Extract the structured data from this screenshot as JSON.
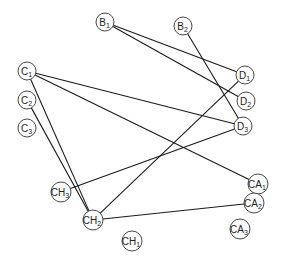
{
  "diagram": {
    "type": "bipartite-graph",
    "nodes": [
      {
        "id": "B1",
        "base": "B",
        "sub": "1",
        "x": 105,
        "y": 22,
        "r": 9
      },
      {
        "id": "B2",
        "base": "B",
        "sub": "2",
        "x": 183,
        "y": 26,
        "r": 9
      },
      {
        "id": "C1",
        "base": "C",
        "sub": "1",
        "x": 27,
        "y": 71,
        "r": 9
      },
      {
        "id": "C2",
        "base": "C",
        "sub": "2",
        "x": 27,
        "y": 100,
        "r": 9
      },
      {
        "id": "C3",
        "base": "C",
        "sub": "3",
        "x": 27,
        "y": 128,
        "r": 9
      },
      {
        "id": "D1",
        "base": "D",
        "sub": "1",
        "x": 245,
        "y": 75,
        "r": 9
      },
      {
        "id": "D2",
        "base": "D",
        "sub": "2",
        "x": 246,
        "y": 101,
        "r": 9
      },
      {
        "id": "D3",
        "base": "D",
        "sub": "3",
        "x": 243,
        "y": 126,
        "r": 9
      },
      {
        "id": "CH3",
        "base": "CH",
        "sub": "3",
        "x": 61,
        "y": 192,
        "r": 10
      },
      {
        "id": "CH2",
        "base": "CH",
        "sub": "2",
        "x": 93,
        "y": 220,
        "r": 10
      },
      {
        "id": "CH1",
        "base": "CH",
        "sub": "1",
        "x": 132,
        "y": 241,
        "r": 10
      },
      {
        "id": "CA1",
        "base": "CA",
        "sub": "1",
        "x": 258,
        "y": 184,
        "r": 10
      },
      {
        "id": "CA2",
        "base": "CA",
        "sub": "2",
        "x": 254,
        "y": 203,
        "r": 10
      },
      {
        "id": "CA3",
        "base": "CA",
        "sub": "3",
        "x": 240,
        "y": 229,
        "r": 10
      }
    ],
    "edges": [
      {
        "from": "B1",
        "to": "D1"
      },
      {
        "from": "B1",
        "to": "D2"
      },
      {
        "from": "B2",
        "to": "D3"
      },
      {
        "from": "C1",
        "to": "D3"
      },
      {
        "from": "C1",
        "to": "CA1"
      },
      {
        "from": "C1",
        "to": "CH2"
      },
      {
        "from": "C2",
        "to": "CH2"
      },
      {
        "from": "CH3",
        "to": "D3"
      },
      {
        "from": "CH2",
        "to": "D1"
      },
      {
        "from": "CH2",
        "to": "CA2"
      }
    ],
    "colors": {
      "edge": "#1a1a1a",
      "node_stroke": "#333333",
      "node_fill": "#ffffff",
      "label": "#222222"
    }
  }
}
